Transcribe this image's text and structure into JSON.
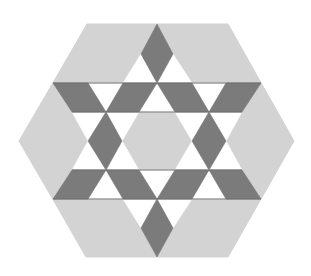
{
  "figure": {
    "colors": {
      "background": "#ffffff",
      "light_gray": "#d3d3d3",
      "dark_gray": "#7b7b7b",
      "white": "#ffffff",
      "line": "#6e6e6e"
    },
    "outer_hexagon": [
      [
        87,
        24
      ],
      [
        228,
        24
      ],
      [
        294,
        141
      ],
      [
        228,
        257
      ],
      [
        86,
        257
      ],
      [
        19,
        141
      ]
    ],
    "light_regions": [
      {
        "name": "top-left-region",
        "points": [
          [
            87,
            24
          ],
          [
            157,
            24
          ],
          [
            141,
            54
          ],
          [
            123,
            83
          ],
          [
            53,
            83
          ]
        ]
      },
      {
        "name": "top-right-region",
        "points": [
          [
            157,
            24
          ],
          [
            228,
            24
          ],
          [
            261,
            83
          ],
          [
            192,
            83
          ],
          [
            173,
            54
          ]
        ]
      },
      {
        "name": "left-region",
        "points": [
          [
            53,
            83
          ],
          [
            72,
            112
          ],
          [
            88,
            141
          ],
          [
            72,
            170
          ],
          [
            53,
            199
          ],
          [
            19,
            141
          ]
        ]
      },
      {
        "name": "right-region",
        "points": [
          [
            261,
            83
          ],
          [
            294,
            141
          ],
          [
            261,
            199
          ],
          [
            242,
            170
          ],
          [
            226,
            141
          ],
          [
            242,
            112
          ]
        ]
      },
      {
        "name": "bottom-left-region",
        "points": [
          [
            53,
            199
          ],
          [
            123,
            199
          ],
          [
            141,
            228
          ],
          [
            157,
            257
          ],
          [
            86,
            257
          ]
        ]
      },
      {
        "name": "bottom-right-region",
        "points": [
          [
            192,
            199
          ],
          [
            261,
            199
          ],
          [
            228,
            257
          ],
          [
            157,
            257
          ],
          [
            173,
            228
          ]
        ]
      },
      {
        "name": "center-hexagon",
        "points": [
          [
            139,
            112
          ],
          [
            175,
            112
          ],
          [
            192,
            141
          ],
          [
            175,
            170
          ],
          [
            139,
            170
          ],
          [
            122,
            141
          ]
        ]
      }
    ],
    "dark_diamonds": [
      {
        "name": "top-diamond",
        "points": [
          [
            157,
            24
          ],
          [
            173,
            54
          ],
          [
            157,
            83
          ],
          [
            141,
            54
          ]
        ]
      },
      {
        "name": "bottom-diamond",
        "points": [
          [
            157,
            199
          ],
          [
            173,
            228
          ],
          [
            157,
            257
          ],
          [
            141,
            228
          ]
        ]
      },
      {
        "name": "upper-band-left",
        "points": [
          [
            53,
            83
          ],
          [
            88,
            83
          ],
          [
            106,
            112
          ],
          [
            72,
            112
          ]
        ]
      },
      {
        "name": "upper-band-center-left",
        "points": [
          [
            123,
            83
          ],
          [
            157,
            83
          ],
          [
            139,
            112
          ],
          [
            106,
            112
          ]
        ]
      },
      {
        "name": "upper-band-center-right",
        "points": [
          [
            157,
            83
          ],
          [
            192,
            83
          ],
          [
            209,
            112
          ],
          [
            175,
            112
          ]
        ]
      },
      {
        "name": "upper-band-right",
        "points": [
          [
            226,
            83
          ],
          [
            261,
            83
          ],
          [
            242,
            112
          ],
          [
            209,
            112
          ]
        ]
      },
      {
        "name": "lower-band-left",
        "points": [
          [
            72,
            170
          ],
          [
            106,
            170
          ],
          [
            88,
            199
          ],
          [
            53,
            199
          ]
        ]
      },
      {
        "name": "lower-band-center-left",
        "points": [
          [
            106,
            170
          ],
          [
            139,
            170
          ],
          [
            157,
            199
          ],
          [
            123,
            199
          ]
        ]
      },
      {
        "name": "lower-band-center-right",
        "points": [
          [
            175,
            170
          ],
          [
            209,
            170
          ],
          [
            192,
            199
          ],
          [
            157,
            199
          ]
        ]
      },
      {
        "name": "lower-band-right",
        "points": [
          [
            209,
            170
          ],
          [
            242,
            170
          ],
          [
            261,
            199
          ],
          [
            226,
            199
          ]
        ]
      },
      {
        "name": "left-diamond",
        "points": [
          [
            106,
            112
          ],
          [
            122,
            141
          ],
          [
            106,
            170
          ],
          [
            88,
            141
          ]
        ]
      },
      {
        "name": "right-diamond",
        "points": [
          [
            209,
            112
          ],
          [
            226,
            141
          ],
          [
            209,
            170
          ],
          [
            192,
            141
          ]
        ]
      }
    ],
    "white_triangles": [
      {
        "name": "top-left-triangle",
        "points": [
          [
            141,
            54
          ],
          [
            157,
            83
          ],
          [
            123,
            83
          ]
        ]
      },
      {
        "name": "top-right-triangle",
        "points": [
          [
            173,
            54
          ],
          [
            192,
            83
          ],
          [
            157,
            83
          ]
        ]
      },
      {
        "name": "band1-left-triangle",
        "points": [
          [
            88,
            83
          ],
          [
            123,
            83
          ],
          [
            106,
            112
          ]
        ]
      },
      {
        "name": "band1-center-triangle",
        "points": [
          [
            157,
            83
          ],
          [
            175,
            112
          ],
          [
            139,
            112
          ]
        ]
      },
      {
        "name": "band1-right-triangle",
        "points": [
          [
            192,
            83
          ],
          [
            226,
            83
          ],
          [
            209,
            112
          ]
        ]
      },
      {
        "name": "mid-upper-left-outer",
        "points": [
          [
            72,
            112
          ],
          [
            106,
            112
          ],
          [
            88,
            141
          ]
        ]
      },
      {
        "name": "mid-upper-left-inner",
        "points": [
          [
            106,
            112
          ],
          [
            139,
            112
          ],
          [
            122,
            141
          ]
        ]
      },
      {
        "name": "mid-upper-right-inner",
        "points": [
          [
            175,
            112
          ],
          [
            209,
            112
          ],
          [
            192,
            141
          ]
        ]
      },
      {
        "name": "mid-upper-right-outer",
        "points": [
          [
            209,
            112
          ],
          [
            242,
            112
          ],
          [
            226,
            141
          ]
        ]
      },
      {
        "name": "mid-lower-left-outer",
        "points": [
          [
            88,
            141
          ],
          [
            106,
            170
          ],
          [
            72,
            170
          ]
        ]
      },
      {
        "name": "mid-lower-left-inner",
        "points": [
          [
            122,
            141
          ],
          [
            139,
            170
          ],
          [
            106,
            170
          ]
        ]
      },
      {
        "name": "mid-lower-right-inner",
        "points": [
          [
            192,
            141
          ],
          [
            209,
            170
          ],
          [
            175,
            170
          ]
        ]
      },
      {
        "name": "mid-lower-right-outer",
        "points": [
          [
            226,
            141
          ],
          [
            242,
            170
          ],
          [
            209,
            170
          ]
        ]
      },
      {
        "name": "band2-left-triangle",
        "points": [
          [
            106,
            170
          ],
          [
            123,
            199
          ],
          [
            88,
            199
          ]
        ]
      },
      {
        "name": "band2-center-triangle",
        "points": [
          [
            139,
            170
          ],
          [
            175,
            170
          ],
          [
            157,
            199
          ]
        ]
      },
      {
        "name": "band2-right-triangle",
        "points": [
          [
            209,
            170
          ],
          [
            226,
            199
          ],
          [
            192,
            199
          ]
        ]
      },
      {
        "name": "bottom-left-triangle",
        "points": [
          [
            123,
            199
          ],
          [
            157,
            199
          ],
          [
            141,
            228
          ]
        ]
      },
      {
        "name": "bottom-right-triangle",
        "points": [
          [
            157,
            199
          ],
          [
            192,
            199
          ],
          [
            173,
            228
          ]
        ]
      }
    ],
    "band_lines": [
      {
        "name": "line-y83",
        "from": [
          53,
          83
        ],
        "to": [
          261,
          83
        ]
      },
      {
        "name": "line-y112",
        "from": [
          72,
          112
        ],
        "to": [
          242,
          112
        ]
      },
      {
        "name": "line-y170",
        "from": [
          72,
          170
        ],
        "to": [
          242,
          170
        ]
      },
      {
        "name": "line-y199",
        "from": [
          53,
          199
        ],
        "to": [
          261,
          199
        ]
      }
    ]
  }
}
